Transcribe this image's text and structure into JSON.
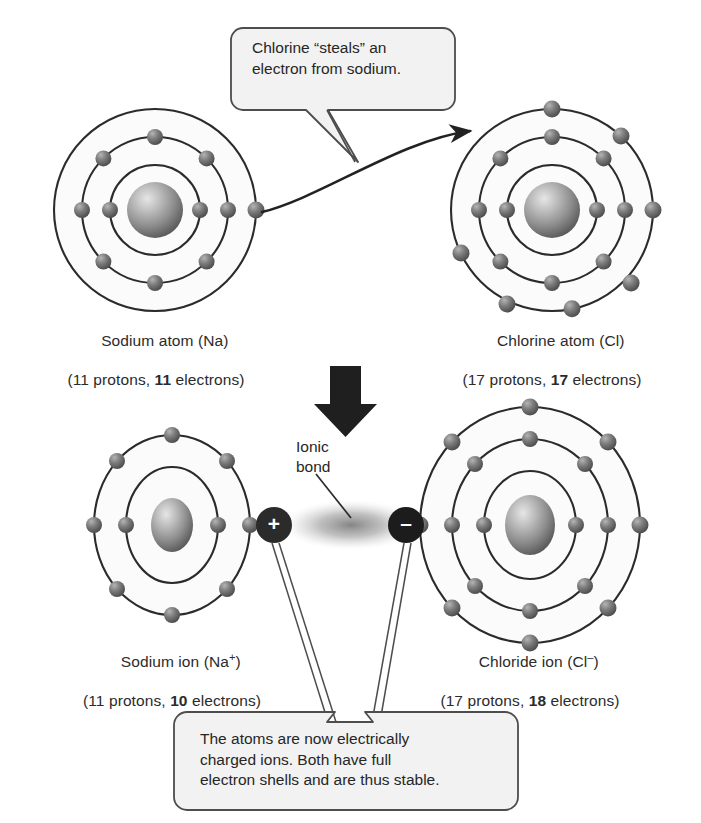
{
  "figure": {
    "background_color": "#ffffff",
    "ink_color": "#2b2b2b",
    "nucleus_color": "#8a8a8a",
    "electron_color": "#5e5e5e",
    "charge_badge_color": "#2b2b2b"
  },
  "callouts": {
    "top": {
      "text": "Chlorine “steals” an\nelectron from sodium.",
      "fill": "#f2f2f2",
      "stroke": "#4d4d4d"
    },
    "bottom": {
      "text": "The atoms are now electrically\ncharged ions. Both have full\nelectron shells and are thus stable.",
      "fill": "#f2f2f2",
      "stroke": "#4d4d4d"
    }
  },
  "annotations": {
    "ionic_bond_label": "Ionic\nbond",
    "plus_charge": "+",
    "minus_charge": "–"
  },
  "atoms": [
    {
      "id": "sodium-atom",
      "name_line": "Sodium atom (Na)",
      "counts_prefix": "(11 protons, ",
      "counts_bold": "11",
      "counts_suffix": " electrons)",
      "protons": 11,
      "electrons": 11,
      "shells": [
        2,
        8,
        1
      ],
      "cx": 155,
      "cy": 210,
      "shell_radii": [
        45,
        73,
        101
      ]
    },
    {
      "id": "chlorine-atom",
      "name_line": "Chlorine atom (Cl)",
      "counts_prefix": "(17 protons, ",
      "counts_bold": "17",
      "counts_suffix": " electrons)",
      "protons": 17,
      "electrons": 17,
      "shells": [
        2,
        8,
        7
      ],
      "cx": 552,
      "cy": 210,
      "shell_radii": [
        45,
        73,
        101
      ]
    },
    {
      "id": "sodium-ion",
      "name_line": "Sodium ion (Na+)",
      "name_base": "Sodium ion (Na",
      "name_sup": "+",
      "name_tail": ")",
      "counts_prefix": "(11 protons, ",
      "counts_bold": "10",
      "counts_suffix": " electrons)",
      "protons": 11,
      "electrons": 10,
      "shells": [
        2,
        8
      ],
      "cx": 172,
      "cy": 525,
      "shell_radii": [
        46,
        78
      ]
    },
    {
      "id": "chloride-ion",
      "name_line": "Chloride ion (Cl−)",
      "name_base": "Chloride ion (Cl",
      "name_sup": "–",
      "name_tail": ")",
      "counts_prefix": "(17 protons, ",
      "counts_bold": "18",
      "counts_suffix": " electrons)",
      "protons": 17,
      "electrons": 18,
      "shells": [
        2,
        8,
        8
      ],
      "cx": 530,
      "cy": 525,
      "shell_radii": [
        46,
        78,
        110
      ]
    }
  ],
  "arrows": {
    "electron_transfer": "curved arrow from sodium outer electron to chlorine shell",
    "reaction": "large downward block arrow"
  }
}
